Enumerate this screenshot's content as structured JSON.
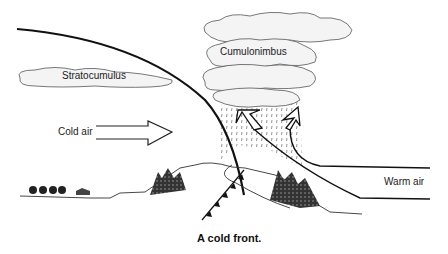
{
  "diagram": {
    "caption": "A cold front.",
    "labels": {
      "stratocumulus": "Stratocumulus",
      "cumulonimbus": "Cumulonimbus",
      "cold_air": "Cold air",
      "warm_air": "Warm air"
    },
    "colors": {
      "line": "#111111",
      "cloud_fill": "#f4f4f4",
      "cloud_stroke": "#555555",
      "background": "#ffffff"
    }
  }
}
